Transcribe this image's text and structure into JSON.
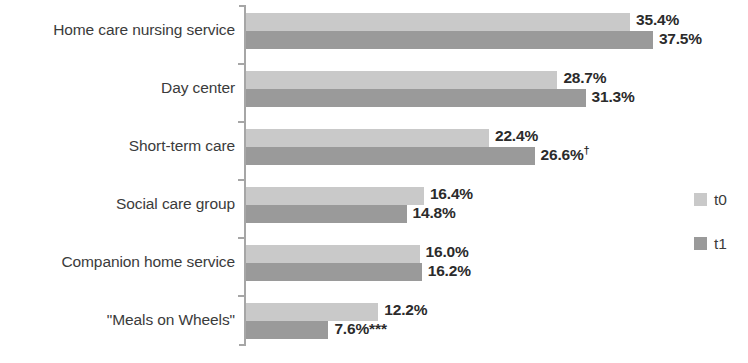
{
  "chart_data": {
    "type": "bar",
    "orientation": "horizontal",
    "title": "",
    "xlabel": "",
    "ylabel": "",
    "xlim": [
      0,
      40
    ],
    "grid": false,
    "legend_position": "right",
    "categories": [
      "Home care nursing service",
      "Day center",
      "Short-term care",
      "Social care group",
      "Companion home service",
      "\"Meals on Wheels\""
    ],
    "series": [
      {
        "name": "t0",
        "color": "#c9c9c9",
        "values": [
          35.4,
          28.7,
          22.4,
          16.4,
          16.0,
          12.2
        ],
        "labels": [
          "35.4%",
          "28.7%",
          "22.4%",
          "16.4%",
          "16.0%",
          "12.2%"
        ],
        "annotations": [
          "",
          "",
          "",
          "",
          "",
          ""
        ]
      },
      {
        "name": "t1",
        "color": "#9a9a9a",
        "values": [
          37.5,
          31.3,
          26.6,
          14.8,
          16.2,
          7.6
        ],
        "labels": [
          "37.5%",
          "31.3%",
          "26.6%",
          "14.8%",
          "16.2%",
          "7.6%"
        ],
        "annotations": [
          "",
          "",
          "†",
          "",
          "",
          "***"
        ]
      }
    ]
  },
  "legend": {
    "items": [
      {
        "label": "t0",
        "color": "#c9c9c9"
      },
      {
        "label": "t1",
        "color": "#9a9a9a"
      }
    ]
  },
  "axis": {
    "color": "#a6a6a6"
  }
}
